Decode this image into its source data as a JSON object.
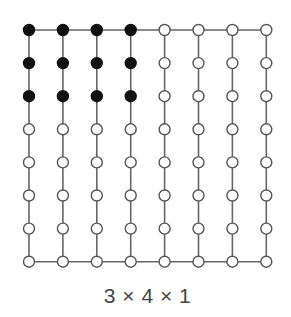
{
  "diagram": {
    "caption": "3 × 4 × 1",
    "grid": {
      "columns": 8,
      "rows": 8,
      "x0": 29,
      "y0": 30,
      "dx": 33.9,
      "dy": 33.1,
      "node_radius": 5.5
    },
    "highlight": {
      "rows": 3,
      "columns": 4,
      "fill_color": "#111111"
    },
    "colors": {
      "line": "#666666",
      "node_stroke": "#555555",
      "node_fill_empty": "#ffffff"
    },
    "edges": {
      "top_horizontal": true,
      "bottom_horizontal": true,
      "vertical_per_column": true
    }
  }
}
